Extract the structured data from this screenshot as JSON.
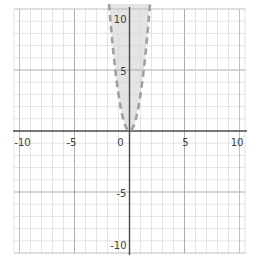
{
  "chart_data": {
    "type": "area",
    "title": "",
    "boundary": {
      "equation_estimate": "y = 3x^2",
      "style": "dashed",
      "vertex": [
        0,
        0
      ],
      "sample_points": [
        [
          -1.8,
          9.7
        ],
        [
          -1.3,
          5
        ],
        [
          -1,
          3
        ],
        [
          0,
          0
        ],
        [
          1,
          3
        ],
        [
          1.3,
          5
        ],
        [
          1.8,
          9.7
        ]
      ]
    },
    "shaded_region": "y > 3x^2 (inside the parabola, above the dashed curve)",
    "axes": {
      "xlim": [
        -10.5,
        10.5
      ],
      "ylim": [
        -10,
        10.4
      ],
      "xticks": [
        {
          "value": -10,
          "label": "-10"
        },
        {
          "value": -5,
          "label": "-5"
        },
        {
          "value": 0,
          "label": "0"
        },
        {
          "value": 5,
          "label": "5"
        },
        {
          "value": 10,
          "label": "10"
        }
      ],
      "yticks": [
        {
          "value": 10,
          "label": "10"
        },
        {
          "value": 5,
          "label": "5"
        },
        {
          "value": -5,
          "label": "-5"
        },
        {
          "value": -10,
          "label": "-10"
        }
      ],
      "grid": {
        "minor_step": 1,
        "major_step": 5,
        "visible": true
      },
      "legend": "none"
    },
    "colors": {
      "background": "#ffffff",
      "minor_grid": "#d9d9d9",
      "major_grid": "#a3a3a3",
      "edge_grid": "#b8b8b8",
      "axis": "#4a4a4a",
      "region_fill": "rgba(172,172,172,0.32)",
      "boundary_dash": "#a0a0a0",
      "tick_label": "#3d3d3d"
    }
  }
}
